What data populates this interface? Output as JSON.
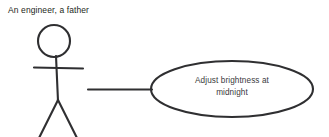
{
  "diagram": {
    "type": "uml-use-case",
    "background_color": "#ffffff",
    "stroke_color": "#2f2f31",
    "actor": {
      "label": "An engineer, a father",
      "label_color": "#231f20",
      "shape": "stick-figure",
      "head_center": [
        54,
        41
      ],
      "head_radius": 16,
      "arms_y": 68,
      "arms_x": [
        34,
        83
      ],
      "body_top": 57,
      "body_bottom": 100,
      "legs_end": [
        [
          40,
          137
        ],
        [
          77,
          137
        ]
      ]
    },
    "use_case": {
      "text_lines": [
        "Adjust brightness at",
        "midnight"
      ],
      "text_color": "#3a3a3c",
      "center": [
        232,
        89
      ],
      "radius_x": 81,
      "radius_y": 28
    },
    "association": {
      "from": [
        88,
        89
      ],
      "to": [
        151,
        89
      ]
    }
  }
}
